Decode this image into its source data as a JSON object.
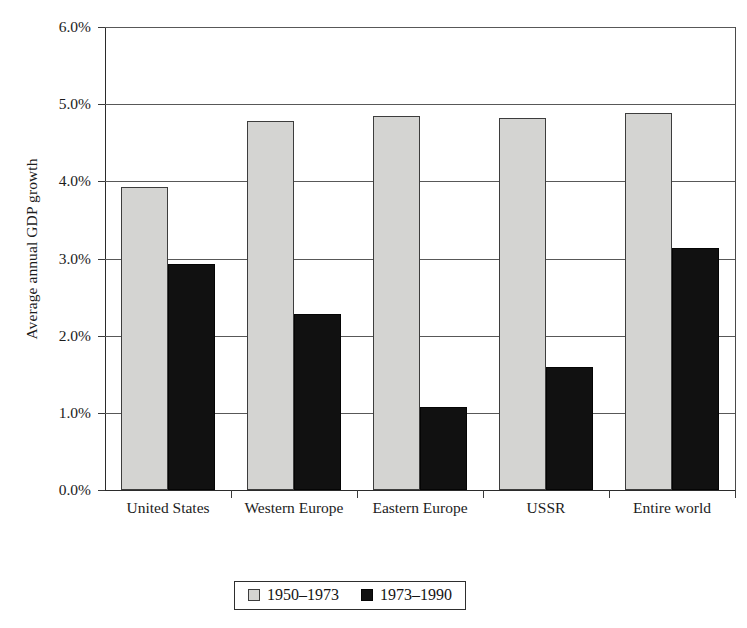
{
  "chart_data": {
    "type": "bar",
    "title": "",
    "xlabel": "",
    "ylabel": "Average annual GDP growth",
    "categories": [
      "United States",
      "Western Europe",
      "Eastern Europe",
      "USSR",
      "Entire world"
    ],
    "series": [
      {
        "name": "1950–1973",
        "color": "#d4d4d2",
        "values": [
          3.93,
          4.78,
          4.85,
          4.82,
          4.88
        ]
      },
      {
        "name": "1973–1990",
        "color": "#111111",
        "values": [
          2.93,
          2.28,
          1.08,
          1.6,
          3.13
        ]
      }
    ],
    "ylim": [
      0.0,
      6.0
    ],
    "ytick_values": [
      0.0,
      1.0,
      2.0,
      3.0,
      4.0,
      5.0,
      6.0
    ],
    "ytick_labels": [
      "0.0%",
      "1.0%",
      "2.0%",
      "3.0%",
      "4.0%",
      "5.0%",
      "6.0%"
    ],
    "grid": true,
    "legend_position": "bottom-center",
    "value_unit": "%"
  },
  "axis": {
    "y_title": "Average annual GDP growth"
  },
  "legend": {
    "entries": [
      {
        "label": "1950–1973",
        "swatch": "light"
      },
      {
        "label": "1973–1990",
        "swatch": "dark"
      }
    ]
  }
}
